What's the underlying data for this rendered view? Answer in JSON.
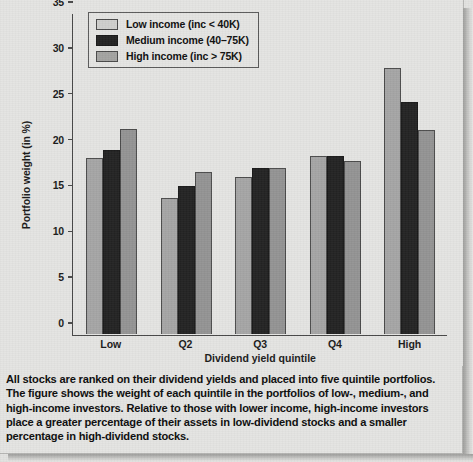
{
  "chart_data": {
    "type": "bar",
    "title": "",
    "xlabel": "Dividend yield quintile",
    "ylabel": "Portfolio weight (in %)",
    "categories": [
      "Low",
      "Q2",
      "Q3",
      "Q4",
      "High"
    ],
    "ylim": [
      0,
      35
    ],
    "yticks": [
      0,
      5,
      10,
      15,
      20,
      25,
      30,
      35
    ],
    "grid": false,
    "legend_position": "top-left",
    "series": [
      {
        "name": "Low income (inc < 40K)",
        "color": "#a6a6a6",
        "values": [
          19.2,
          14.8,
          17.1,
          19.4,
          29.1
        ]
      },
      {
        "name": "Medium income (40–75K)",
        "color": "#242424",
        "values": [
          20.1,
          16.2,
          18.1,
          19.5,
          25.4
        ]
      },
      {
        "name": "High income (inc > 75K)",
        "color": "#949494",
        "values": [
          22.4,
          17.7,
          18.1,
          18.9,
          22.3
        ]
      }
    ]
  },
  "legend": {
    "items": [
      {
        "label": "Low income (inc < 40K)"
      },
      {
        "label": "Medium income (40–75K)"
      },
      {
        "label": "High income (inc > 75K)"
      }
    ]
  },
  "caption": {
    "text": "All stocks are ranked on their dividend yields and placed into five quintile portfolios. The figure shows the weight of each quintile in the portfolios of low-, medium-, and high-income investors. Relative to those with lower income, high-income investors place a greater percentage of their assets in low-dividend stocks and a smaller percentage in high-dividend stocks."
  }
}
